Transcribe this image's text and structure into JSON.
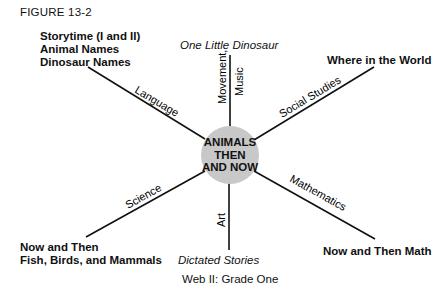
{
  "figure_label": "FIGURE 13-2",
  "center": {
    "lines": [
      "ANIMALS",
      "THEN",
      "AND NOW"
    ],
    "fill": "#c8c8c8"
  },
  "spokes": [
    {
      "id": "language",
      "label": "Language",
      "activity": [
        "Storytime (I and II)",
        "Animal Names",
        "Dinosaur Names"
      ],
      "activity_style": "bold"
    },
    {
      "id": "movement-music",
      "label_lines": [
        "Movement,",
        "Music"
      ],
      "activity": [
        "One Little Dinosaur"
      ],
      "activity_style": "italic"
    },
    {
      "id": "social-studies",
      "label": "Social Studies",
      "activity": [
        "Where in the World"
      ],
      "activity_style": "bold"
    },
    {
      "id": "mathematics",
      "label": "Mathematics",
      "activity": [
        "Now and Then Math"
      ],
      "activity_style": "bold"
    },
    {
      "id": "art",
      "label": "Art",
      "activity": [
        "Dictated Stories"
      ],
      "activity_style": "italic"
    },
    {
      "id": "science",
      "label": "Science",
      "activity": [
        "Now and Then",
        "Fish, Birds, and Mammals"
      ],
      "activity_style": "bold"
    }
  ],
  "caption": "Web II:  Grade One"
}
